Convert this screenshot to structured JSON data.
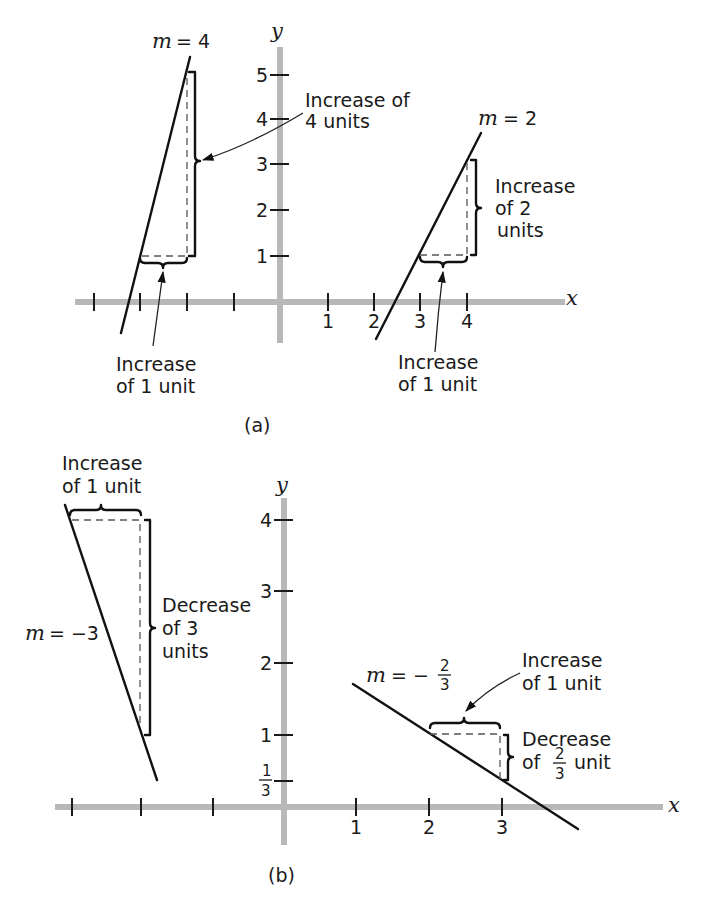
{
  "panel_a": {
    "caption": "(a)",
    "axis_x_label": "x",
    "axis_y_label": "y",
    "x_tick_labels": [
      "1",
      "2",
      "3",
      "4"
    ],
    "y_tick_labels": [
      "1",
      "2",
      "3",
      "4",
      "5"
    ],
    "line_steep": {
      "slope_label_m": "m",
      "slope_label_eq": "= 4",
      "rise_label": [
        "Increase of",
        "4 units"
      ],
      "run_label": [
        "Increase",
        "of 1 unit"
      ]
    },
    "line_shallow": {
      "slope_label_m": "m",
      "slope_label_eq": "= 2",
      "rise_label": [
        "Increase",
        "of 2",
        "units"
      ],
      "run_label": [
        "Increase",
        "of 1 unit"
      ]
    }
  },
  "panel_b": {
    "caption": "(b)",
    "axis_x_label": "x",
    "axis_y_label": "y",
    "x_tick_labels": [
      "1",
      "2",
      "3"
    ],
    "y_tick_labels": [
      "1",
      "2",
      "3",
      "4"
    ],
    "y_fraction_tick": {
      "num": "1",
      "den": "3"
    },
    "line_steep": {
      "slope_label_m": "m",
      "slope_label_eq": "= −3",
      "run_label": [
        "Increase",
        "of 1 unit"
      ],
      "fall_label": [
        "Decrease",
        "of 3",
        "units"
      ]
    },
    "line_shallow": {
      "slope_label_m": "m",
      "slope_label_eq": "= −",
      "slope_fraction": {
        "num": "2",
        "den": "3"
      },
      "run_label": [
        "Increase",
        "of 1 unit"
      ],
      "fall_label_line1": "Decrease",
      "fall_label_prefix": "of",
      "fall_fraction": {
        "num": "2",
        "den": "3"
      },
      "fall_label_suffix": "unit"
    }
  },
  "colors": {
    "axis": "#b8b8b8",
    "ink": "#111111",
    "background": "#ffffff"
  }
}
